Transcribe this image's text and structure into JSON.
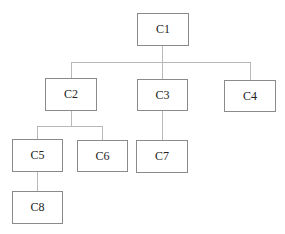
{
  "diagram": {
    "type": "tree",
    "nodes": [
      {
        "id": "C1",
        "label": "C1"
      },
      {
        "id": "C2",
        "label": "C2",
        "parent": "C1"
      },
      {
        "id": "C3",
        "label": "C3",
        "parent": "C1"
      },
      {
        "id": "C4",
        "label": "C4",
        "parent": "C1"
      },
      {
        "id": "C5",
        "label": "C5",
        "parent": "C2"
      },
      {
        "id": "C6",
        "label": "C6",
        "parent": "C2"
      },
      {
        "id": "C7",
        "label": "C7",
        "parent": "C3"
      },
      {
        "id": "C8",
        "label": "C8",
        "parent": "C5"
      }
    ]
  }
}
